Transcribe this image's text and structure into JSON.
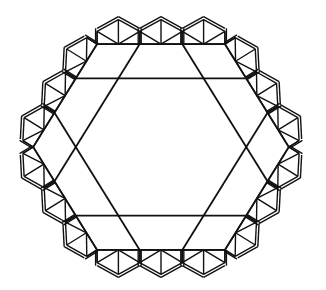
{
  "diagram": {
    "type": "geometric-figure",
    "colors": {
      "background": "#ffffff",
      "stroke": "#111111"
    },
    "center": [
      161,
      147
    ],
    "unit": 42.6,
    "inner_grid_divisions": 3,
    "border_cells_per_side": 3
  }
}
